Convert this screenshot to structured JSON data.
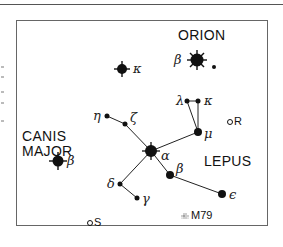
{
  "constellations": {
    "orion": "ORION",
    "canis_major": "CANIS\nMAJOR",
    "canis_major_line1": "CANIS",
    "canis_major_line2": "MAJOR",
    "lepus": "LEPUS"
  },
  "stars": {
    "orion_kappa": "κ",
    "orion_beta": "β",
    "canis_major_beta": "β",
    "lepus_alpha": "α",
    "lepus_beta": "β",
    "lepus_gamma": "γ",
    "lepus_delta": "δ",
    "lepus_epsilon": "ϵ",
    "lepus_zeta": "ζ",
    "lepus_eta": "η",
    "lepus_kappa": "κ",
    "lepus_lambda": "λ",
    "lepus_mu": "μ"
  },
  "objects": {
    "r": "R",
    "s": "S",
    "m79": "M79"
  },
  "colors": {
    "ink": "#111111",
    "frame": "#666666",
    "background": "#ffffff"
  }
}
